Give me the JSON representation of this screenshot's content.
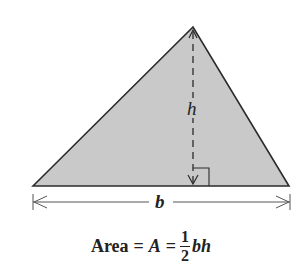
{
  "figure": {
    "type": "triangle-area-diagram",
    "colors": {
      "fill": "#c9c9c9",
      "stroke": "#2b2b2b",
      "text": "#222222"
    },
    "triangle": {
      "vertices": {
        "left": [
          33,
          186
        ],
        "apex": [
          193,
          27
        ],
        "right": [
          289,
          186
        ]
      },
      "height_line": {
        "from": [
          193,
          30
        ],
        "to": [
          193,
          185
        ],
        "style": "dashed"
      },
      "right_angle_marker": {
        "x": 193,
        "y": 168,
        "size": 16
      }
    },
    "labels": {
      "height": "h",
      "base": "b"
    },
    "base_dimension": {
      "y": 202,
      "x_start": 33,
      "x_end": 290
    },
    "formula": {
      "word": "Area",
      "eq1": "=",
      "var": "A",
      "eq2": "=",
      "fraction_numerator": "1",
      "fraction_denominator": "2",
      "tail": "bh"
    }
  }
}
